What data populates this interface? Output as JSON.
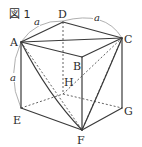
{
  "figure": {
    "title": "図 1",
    "shape": "cube",
    "vertices": {
      "A": {
        "label": "A",
        "x": 21,
        "y": 42
      },
      "B": {
        "label": "B",
        "x": 82,
        "y": 57
      },
      "C": {
        "label": "C",
        "x": 122,
        "y": 38
      },
      "D": {
        "label": "D",
        "x": 63,
        "y": 22
      },
      "E": {
        "label": "E",
        "x": 21,
        "y": 108
      },
      "F": {
        "label": "F",
        "x": 82,
        "y": 130
      },
      "G": {
        "label": "G",
        "x": 122,
        "y": 108
      },
      "H": {
        "label": "H",
        "x": 63,
        "y": 94
      }
    },
    "solid_edges": [
      "AD",
      "DC",
      "AB",
      "BC",
      "AE",
      "EF",
      "BF",
      "CG",
      "FG",
      "AC",
      "AF",
      "CF"
    ],
    "dashed_edges": [
      "DH",
      "EH",
      "HG",
      "AH",
      "HC",
      "HF"
    ],
    "length_labels": [
      {
        "id": "AD",
        "text": "a"
      },
      {
        "id": "DC",
        "text": "a"
      },
      {
        "id": "AE",
        "text": "a"
      }
    ]
  }
}
